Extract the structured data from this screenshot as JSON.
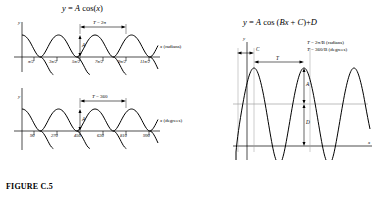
{
  "figure": {
    "caption": "FIGURE C.5"
  },
  "left_panel": {
    "equation_parts": {
      "lhs": "y",
      "eq": " = ",
      "A": "A",
      "fn": " cos(",
      "var": "x",
      "close": ")"
    },
    "equation_text": "y = A cos(x)",
    "radians_graph": {
      "y_axis_label": "y",
      "x_axis_label_var": "x",
      "x_axis_label_unit": " (radians)",
      "period_label_var": "T",
      "period_label_value": " = 2π",
      "amplitude_label": "A",
      "tick_labels": [
        "π/2",
        "3π/2",
        "5π/2",
        "7π/2",
        "9π/2",
        "11π/2"
      ]
    },
    "degrees_graph": {
      "y_axis_label": "y",
      "x_axis_label_var": "x",
      "x_axis_label_unit": " (degrees)",
      "period_label_var": "T",
      "period_label_value": " = 360",
      "amplitude_label": "A",
      "tick_labels": [
        "90",
        "270",
        "450",
        "630",
        "810",
        "990"
      ]
    }
  },
  "right_panel": {
    "equation_text": "y = A cos (Bx + C)+D",
    "equation_parts": {
      "lhs": "y",
      "eq": " = ",
      "A": "A",
      "fn": " cos (",
      "B": "B",
      "var": "x",
      "plus": " + ",
      "C": "C",
      "close": ")+",
      "D": "D"
    },
    "y_axis_label": "y",
    "x_axis_label": "x",
    "phase_label": "C",
    "period_label": "T",
    "amplitude_label": "A",
    "offset_label": "D",
    "period_note_radians_var": "T",
    "period_note_radians": " = 2π/B (radians)",
    "period_note_degrees_var": "T",
    "period_note_degrees": " = 360/B (degrees)"
  },
  "style": {
    "curve_color": "#000000",
    "axis_color": "#000000",
    "guide_color": "#9a9a9a",
    "background": "#ffffff"
  }
}
